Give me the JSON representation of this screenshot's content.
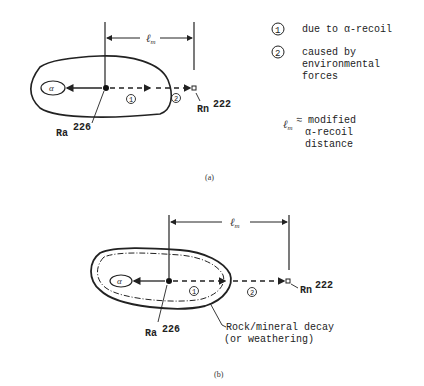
{
  "panel_a": {
    "alpha": "α",
    "ra": "Ra",
    "ra_sup": "226",
    "rn": "Rn",
    "rn_sup": "222",
    "lm": "ℓ",
    "lm_sub": "m",
    "marker1": "1",
    "marker2": "2",
    "caption": "(a)"
  },
  "legend": {
    "item1_num": "1",
    "item1_text": "due to α-recoil",
    "item2_num": "2",
    "item2_line1": "caused by",
    "item2_line2": "environmental",
    "item2_line3": "forces",
    "lm_symbol": "ℓ",
    "lm_sub": "m",
    "lm_line1": "≈ modified",
    "lm_line2": "α-recoil",
    "lm_line3": "distance"
  },
  "panel_b": {
    "alpha": "α",
    "ra": "Ra",
    "ra_sup": "226",
    "rn": "Rn",
    "rn_sup": "222",
    "lm": "ℓ",
    "lm_sub": "m",
    "marker1": "1",
    "marker2": "2",
    "decay_line1": "Rock/mineral decay",
    "decay_line2": "(or weathering)",
    "caption": "(b)"
  }
}
